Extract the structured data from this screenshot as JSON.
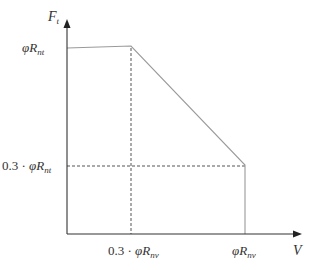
{
  "diagram": {
    "type": "interaction-curve",
    "axes": {
      "y_label": "F",
      "y_label_sub": "t",
      "x_label": "V"
    },
    "y_ticks": [
      {
        "prefix": "",
        "symbol": "φR",
        "sub": "nt",
        "role": "max-tension"
      },
      {
        "prefix": "0.3 · ",
        "symbol": "φR",
        "sub": "nt",
        "role": "reduced-tension"
      }
    ],
    "x_ticks": [
      {
        "prefix": "0.3 · ",
        "symbol": "φR",
        "sub": "nv",
        "role": "reduced-shear"
      },
      {
        "prefix": "",
        "symbol": "φR",
        "sub": "nv",
        "role": "max-shear"
      }
    ],
    "curve_points": [
      {
        "x": 0,
        "y": "φRnt"
      },
      {
        "x": "0.3·φRnv",
        "y": "φRnt"
      },
      {
        "x": "φRnv",
        "y": "0.3·φRnt"
      },
      {
        "x": "φRnv",
        "y": 0
      }
    ],
    "colors": {
      "axis": "#333333",
      "curve": "#9a9a9a",
      "guide": "#555555",
      "text": "#333333"
    }
  }
}
